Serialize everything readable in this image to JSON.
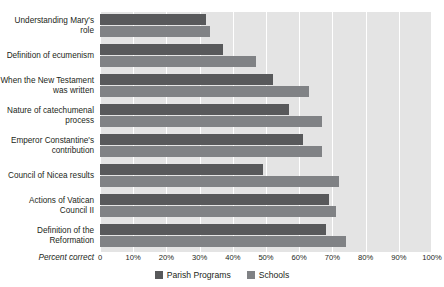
{
  "chart_data": {
    "type": "bar",
    "orientation": "horizontal",
    "title": "",
    "xlabel": "Percent correct",
    "ylabel": "",
    "xlim": [
      0,
      100
    ],
    "grid": true,
    "legend_position": "bottom-center",
    "tick_labels": [
      "0",
      "10%",
      "20%",
      "30%",
      "40%",
      "50%",
      "60%",
      "70%",
      "80%",
      "90%",
      "100%"
    ],
    "tick_values": [
      0,
      10,
      20,
      30,
      40,
      50,
      60,
      70,
      80,
      90,
      100
    ],
    "categories": [
      "Understanding Mary's role",
      "Definition of ecumenism",
      "When the New Testament was written",
      "Nature of catechumenal process",
      "Emperor Constantine's contribution",
      "Council of Nicea results",
      "Actions of Vatican Council II",
      "Definition of the Reformation"
    ],
    "series": [
      {
        "name": "Parish Programs",
        "color": "#58595b",
        "values": [
          32,
          37,
          52,
          57,
          61,
          49,
          69,
          68
        ]
      },
      {
        "name": "Schools",
        "color": "#808285",
        "values": [
          33,
          47,
          63,
          67,
          67,
          72,
          71,
          74
        ]
      }
    ]
  },
  "colors": {
    "plot_background": "#e4e4e4",
    "gridline": "#ffffff",
    "page_background": "#ffffff",
    "text": "#231f20"
  }
}
